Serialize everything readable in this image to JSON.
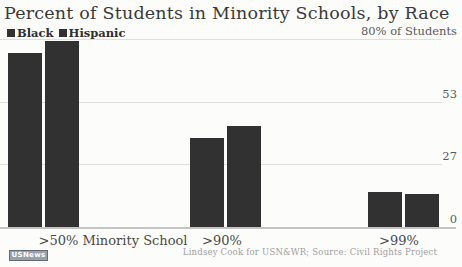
{
  "chart_data": {
    "type": "bar",
    "title": "Percent of Students in Minority Schools, by Race",
    "categories": [
      ">50% Minority School",
      ">90%",
      ">99%"
    ],
    "series": [
      {
        "name": "Black",
        "values": [
          74,
          38,
          15
        ],
        "color": "#313131"
      },
      {
        "name": "Hispanic",
        "values": [
          79,
          43,
          14
        ],
        "color": "#313131"
      }
    ],
    "ylim": [
      0,
      80
    ],
    "yticks": [
      {
        "value": 80,
        "label": "80% of Students"
      },
      {
        "value": 53,
        "label": "53"
      },
      {
        "value": 27,
        "label": "27"
      },
      {
        "value": 0,
        "label": "0"
      }
    ],
    "grid": true,
    "legend_position": "top-left",
    "xlabel": "",
    "ylabel": "% of Students",
    "attribution": "Lindsey Cook for USN&WR; Source: Civil Rights Project",
    "logo_text": "USNews",
    "colors": {
      "bar": "#313131",
      "grid": "#dedede",
      "baseline": "#c4c4c4",
      "title_text": "#3a3a3a",
      "axis_text": "#5a5a5a",
      "muted_text": "#9e9e9e",
      "background": "#fcfcfb"
    }
  }
}
